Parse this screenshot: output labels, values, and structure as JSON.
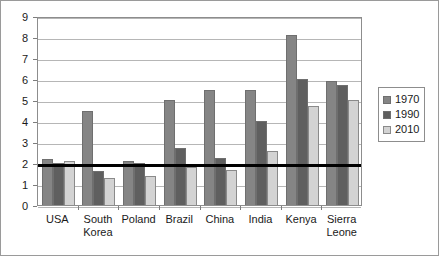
{
  "chart_data": {
    "type": "bar",
    "title": "",
    "xlabel": "",
    "ylabel": "",
    "ylim": [
      0,
      9
    ],
    "ytick_labels": [
      "0",
      "1",
      "2",
      "3",
      "4",
      "5",
      "6",
      "7",
      "8",
      "9"
    ],
    "grid": true,
    "legend_position": "right",
    "categories": [
      "USA",
      "South\nKorea",
      "Poland",
      "Brazil",
      "China",
      "India",
      "Kenya",
      "Sierra\nLeone"
    ],
    "series": [
      {
        "name": "1970",
        "color": "#858585",
        "values": [
          2.2,
          4.5,
          2.1,
          5.0,
          5.5,
          5.5,
          8.1,
          5.9
        ]
      },
      {
        "name": "1990",
        "color": "#5f5f5f",
        "values": [
          2.0,
          1.6,
          2.0,
          2.7,
          2.25,
          4.0,
          6.0,
          5.7
        ]
      },
      {
        "name": "2010",
        "color": "#d3d3d3",
        "values": [
          2.1,
          1.3,
          1.4,
          1.8,
          1.65,
          2.55,
          4.7,
          5.0
        ]
      }
    ],
    "reference_line": {
      "value": 2.0,
      "color": "#000000"
    }
  }
}
